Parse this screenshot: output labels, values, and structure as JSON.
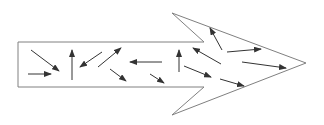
{
  "diagram": {
    "outline_color": "#808080",
    "arrow_color": "#333333",
    "outline_points": [
      [
        18,
        42
      ],
      [
        204,
        42
      ],
      [
        172,
        13
      ],
      [
        306,
        63
      ],
      [
        172,
        115
      ],
      [
        204,
        87
      ],
      [
        18,
        87
      ]
    ],
    "small_arrows": [
      {
        "from": [
          31,
          50
        ],
        "to": [
          59,
          71
        ]
      },
      {
        "from": [
          28,
          74
        ],
        "to": [
          51,
          74
        ]
      },
      {
        "from": [
          72,
          80
        ],
        "to": [
          72,
          50
        ]
      },
      {
        "from": [
          102,
          52
        ],
        "to": [
          80,
          67
        ]
      },
      {
        "from": [
          98,
          67
        ],
        "to": [
          121,
          48
        ]
      },
      {
        "from": [
          110,
          69
        ],
        "to": [
          126,
          81
        ]
      },
      {
        "from": [
          162,
          62
        ],
        "to": [
          130,
          62
        ]
      },
      {
        "from": [
          150,
          74
        ],
        "to": [
          164,
          83
        ]
      },
      {
        "from": [
          179,
          72
        ],
        "to": [
          179,
          50
        ]
      },
      {
        "from": [
          222,
          50
        ],
        "to": [
          210,
          28
        ]
      },
      {
        "from": [
          221,
          64
        ],
        "to": [
          193,
          48
        ]
      },
      {
        "from": [
          227,
          52
        ],
        "to": [
          261,
          49
        ]
      },
      {
        "from": [
          184,
          66
        ],
        "to": [
          211,
          77
        ]
      },
      {
        "from": [
          242,
          62
        ],
        "to": [
          286,
          68
        ]
      },
      {
        "from": [
          220,
          79
        ],
        "to": [
          244,
          86
        ]
      }
    ]
  }
}
